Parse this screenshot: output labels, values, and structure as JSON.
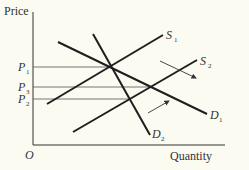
{
  "diagram": {
    "axes": {
      "y_label": "Price",
      "x_label": "Quantity",
      "origin_label": "O"
    },
    "price_levels": [
      {
        "id": "P1",
        "label": "P",
        "sub": "1",
        "y": 67,
        "x_end": 112
      },
      {
        "id": "P3",
        "label": "P",
        "sub": "3",
        "y": 87,
        "x_end": 152
      },
      {
        "id": "P2",
        "label": "P",
        "sub": "2",
        "y": 99,
        "x_end": 128
      }
    ],
    "curves": [
      {
        "id": "S1",
        "label": "S",
        "sub": "1",
        "type": "supply"
      },
      {
        "id": "S2",
        "label": "S",
        "sub": "2",
        "type": "supply"
      },
      {
        "id": "D1",
        "label": "D",
        "sub": "1",
        "type": "demand"
      },
      {
        "id": "D2",
        "label": "D",
        "sub": "2",
        "type": "demand"
      }
    ],
    "arrows": [
      {
        "id": "demand-shift-arrow",
        "direction": "down-right"
      },
      {
        "id": "supply-shift-arrow",
        "direction": "up-right"
      }
    ],
    "colors": {
      "background": "#fbfbf2",
      "line": "#1e1e1e",
      "text": "#333333"
    }
  }
}
